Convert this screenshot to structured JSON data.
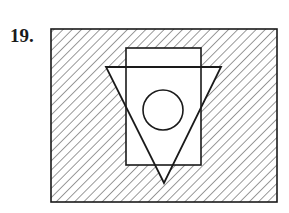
{
  "problem": {
    "number_label": "19."
  },
  "figure": {
    "stroke_color": "#1a1a1a",
    "hatch_color": "#6e6e6e",
    "background": "#ffffff",
    "outer_rectangle": {
      "x": 51,
      "y": 29,
      "width": 226,
      "height": 173,
      "hatched": true
    },
    "inner_rectangle": {
      "x": 126,
      "y": 48,
      "width": 75,
      "height": 117,
      "hatched": false
    },
    "triangle": {
      "points": [
        [
          106,
          67
        ],
        [
          221,
          67
        ],
        [
          164,
          183
        ]
      ],
      "orientation": "inverted",
      "hatched": false
    },
    "circle": {
      "cx": 163,
      "cy": 110,
      "r": 20,
      "hatched": false
    },
    "hatch_pattern": {
      "direction": "diagonal-down-right",
      "spacing": 6.5
    }
  }
}
